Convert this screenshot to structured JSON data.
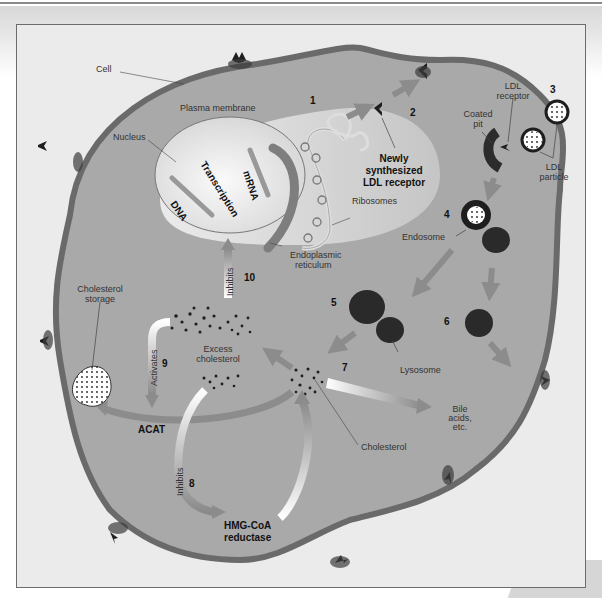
{
  "diagram": {
    "colors": {
      "cytoplasm": "#a9a9a9",
      "membrane": "#6a6a6a",
      "nucleus": "#e6e6e6",
      "arrow": "#8c8c8c",
      "dark": "#1e1e1e",
      "frame_bg": "#ebebeb"
    },
    "labels": {
      "cell": "Cell",
      "plasma_membrane": "Plasma membrane",
      "nucleus": "Nucleus",
      "transcription": "Transcription",
      "mrna": "mRNA",
      "dna": "DNA",
      "ribosomes": "Ribosomes",
      "er_line1": "Endoplasmic",
      "er_line2": "reticulum",
      "newly_line1": "Newly",
      "newly_line2": "synthesized",
      "newly_line3": "LDL receptor",
      "ldl_receptor_line1": "LDL",
      "ldl_receptor_line2": "receptor",
      "coated_pit_line1": "Coated",
      "coated_pit_line2": "pit",
      "ldl_particle_line1": "LDL",
      "ldl_particle_line2": "particle",
      "endosome": "Endosome",
      "lysosome": "Lysosome",
      "cholesterol_storage_line1": "Cholesterol",
      "cholesterol_storage_line2": "storage",
      "excess_line1": "Excess",
      "excess_line2": "cholesterol",
      "inhibits_10": "Inhibits",
      "activates_9": "Activates",
      "acat": "ACAT",
      "inhibits_8": "Inhibits",
      "hmg_line1": "HMG-CoA",
      "hmg_line2": "reductase",
      "cholesterol": "Cholesterol",
      "bile_line1": "Bile",
      "bile_line2": "acids,",
      "bile_line3": "etc."
    },
    "steps": [
      "1",
      "2",
      "3",
      "4",
      "5",
      "6",
      "7",
      "8",
      "9",
      "10"
    ]
  }
}
